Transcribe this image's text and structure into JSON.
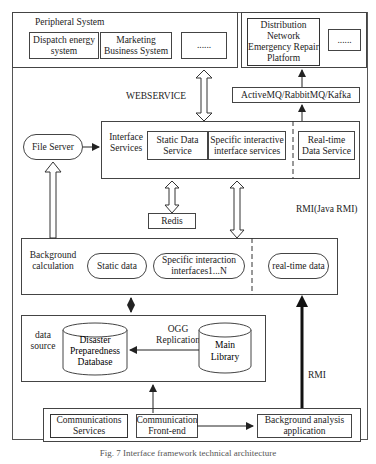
{
  "peripheral": {
    "title": "Peripheral System",
    "items": [
      "Dispatch energy system",
      "Marketing Business System",
      "......"
    ]
  },
  "distribution": {
    "items": [
      "Distribution Network Emergency Repair Platform",
      "......"
    ]
  },
  "mq": "ActiveMQ/RabbitMQ/Kafka",
  "webservice": "WEBSERVICE",
  "file_server": "File Server",
  "interface": {
    "title": "Interface Services",
    "items": [
      "Static Data Service",
      "Specific interactive interface services",
      "Real-time Data Service"
    ]
  },
  "redis": "Redis",
  "rmi_java": "RMI(Java RMI)",
  "background": {
    "title": "Background calculation",
    "items": [
      "Static data",
      "Specific interaction interfaces1...N",
      "real-time data"
    ]
  },
  "datasource": {
    "title": "data source",
    "ogg": "OGG Replication",
    "db1": "Disaster Preparedness Database",
    "db2": "Main Library"
  },
  "rmi": "RMI",
  "bottom": {
    "items": [
      "Communications Services",
      "Communication Front-end",
      "Background analysis application"
    ]
  },
  "caption": "Fig. 7  Interface framework technical architecture"
}
